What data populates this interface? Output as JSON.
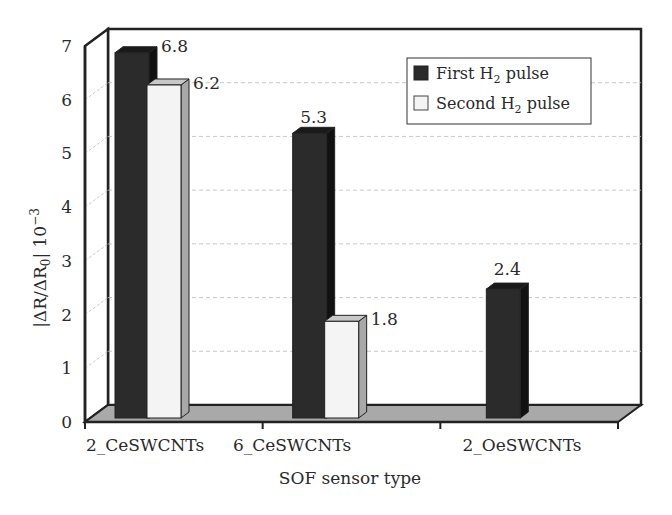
{
  "chart_data": {
    "type": "bar",
    "style": "3d-clustered-column",
    "title": "",
    "xlabel": "SOF sensor type",
    "ylabel": "|ΔR/ΔR0| 10^-3",
    "ylim": [
      0,
      7
    ],
    "yticks": [
      0,
      1,
      2,
      3,
      4,
      5,
      6,
      7
    ],
    "grid": true,
    "legend_position": "upper-right-inside",
    "categories": [
      "2_CeSWCNTs",
      "6_CeSWCNTs",
      "2_OeSWCNTs"
    ],
    "series": [
      {
        "name": "First H2 pulse",
        "values": [
          6.8,
          5.3,
          2.4
        ],
        "color": "#2b2b2b"
      },
      {
        "name": "Second H2 pulse",
        "values": [
          6.2,
          1.8,
          null
        ],
        "color": "#f4f4f4"
      }
    ],
    "data_labels": [
      [
        "6.8",
        "5.3",
        "2.4"
      ],
      [
        "6.2",
        "1.8",
        ""
      ]
    ]
  },
  "labels": {
    "xlabel": "SOF sensor type",
    "ylabel_main": "|ΔR/ΔR",
    "ylabel_sub": "0",
    "ylabel_tail": "| 10",
    "ylabel_exp": "−3",
    "legend": [
      {
        "prefix": "First H",
        "sub": "2",
        "suffix": " pulse"
      },
      {
        "prefix": "Second H",
        "sub": "2",
        "suffix": " pulse"
      }
    ]
  },
  "colors": {
    "first_front": "#2b2b2b",
    "first_top": "#1a1a1a",
    "first_side": "#111111",
    "second_front": "#f4f4f4",
    "second_top": "#c8c8c8",
    "second_side": "#a8a8a8",
    "floor": "#a9a9a9",
    "axis": "#222222",
    "grid": "#bbbbbb"
  }
}
